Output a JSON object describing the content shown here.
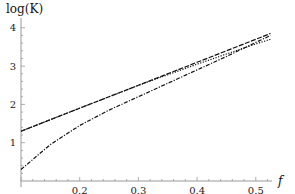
{
  "chart_data": {
    "type": "line",
    "title": "",
    "xlabel": "f",
    "ylabel": "log(K)",
    "xlim": [
      0.1,
      0.53
    ],
    "ylim": [
      0,
      4.2
    ],
    "grid": false,
    "legend": null,
    "x_ticks": [
      "0.2",
      "0.3",
      "0.4",
      "0.5"
    ],
    "y_ticks": [
      "1",
      "2",
      "3",
      "4"
    ],
    "series": [
      {
        "name": "dashed",
        "style": "dashed",
        "x": [
          0.1,
          0.2,
          0.3,
          0.4,
          0.5,
          0.525
        ],
        "y": [
          1.3,
          1.9,
          2.5,
          3.1,
          3.7,
          3.85
        ]
      },
      {
        "name": "dotted",
        "style": "dotted",
        "x": [
          0.1,
          0.2,
          0.3,
          0.4,
          0.5,
          0.525
        ],
        "y": [
          1.3,
          1.9,
          2.5,
          3.05,
          3.58,
          3.7
        ]
      },
      {
        "name": "dash-dot",
        "style": "dashdot",
        "x": [
          0.1,
          0.15,
          0.2,
          0.25,
          0.3,
          0.35,
          0.4,
          0.45,
          0.5,
          0.525
        ],
        "y": [
          0.3,
          0.95,
          1.45,
          1.85,
          2.2,
          2.55,
          2.9,
          3.25,
          3.62,
          3.8
        ]
      }
    ]
  }
}
